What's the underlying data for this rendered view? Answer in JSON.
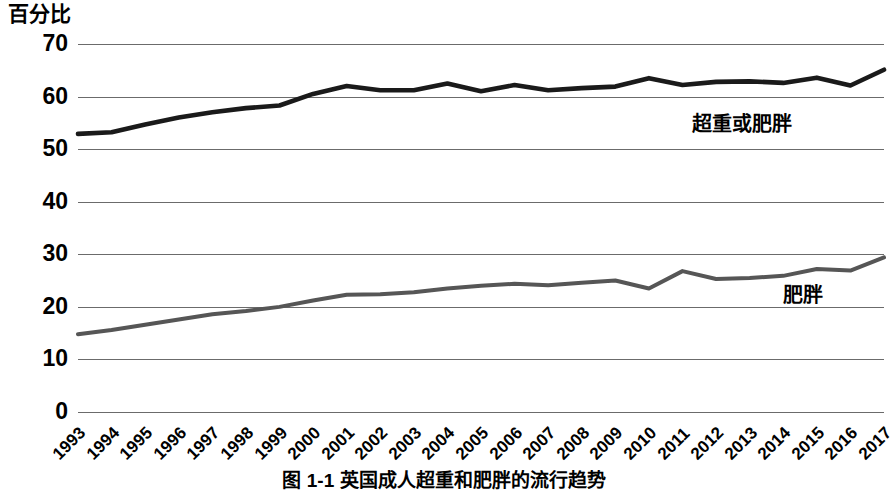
{
  "figure": {
    "y_axis_title": "百分比",
    "caption": "图 1-1  英国成人超重和肥胖的流行趋势"
  },
  "chart_data": {
    "type": "line",
    "title": "图 1-1  英国成人超重和肥胖的流行趋势",
    "xlabel": "",
    "ylabel": "百分比",
    "ylim": [
      0,
      70
    ],
    "yticks": [
      0,
      10,
      20,
      30,
      40,
      50,
      60,
      70
    ],
    "grid": true,
    "legend": "inline-direct-labels",
    "categories": [
      "1993",
      "1994",
      "1995",
      "1996",
      "1997",
      "1998",
      "1999",
      "2000",
      "2001",
      "2002",
      "2003",
      "2004",
      "2005",
      "2006",
      "2007",
      "2008",
      "2009",
      "2010",
      "2011",
      "2012",
      "2013",
      "2014",
      "2015",
      "2016",
      "2017"
    ],
    "series": [
      {
        "name": "超重或肥胖",
        "color": "#1a1a1a",
        "values": [
          52.9,
          53.2,
          54.7,
          56.0,
          57.0,
          57.8,
          58.3,
          60.5,
          62.0,
          61.2,
          61.2,
          62.5,
          61.0,
          62.2,
          61.2,
          61.6,
          61.9,
          63.5,
          62.2,
          62.8,
          62.9,
          62.6,
          63.6,
          62.1,
          65.1
        ]
      },
      {
        "name": "肥胖",
        "color": "#565656",
        "values": [
          14.8,
          15.6,
          16.6,
          17.6,
          18.6,
          19.2,
          20.0,
          21.2,
          22.3,
          22.4,
          22.8,
          23.5,
          24.0,
          24.4,
          24.1,
          24.6,
          25.0,
          23.5,
          26.8,
          25.3,
          25.5,
          25.9,
          27.2,
          26.9,
          29.4
        ]
      }
    ],
    "annotations": [
      {
        "text": "超重或肥胖",
        "near_category": "2012",
        "near_value": 66
      },
      {
        "text": "肥胖",
        "near_category": "2016",
        "near_value": 30
      }
    ]
  }
}
